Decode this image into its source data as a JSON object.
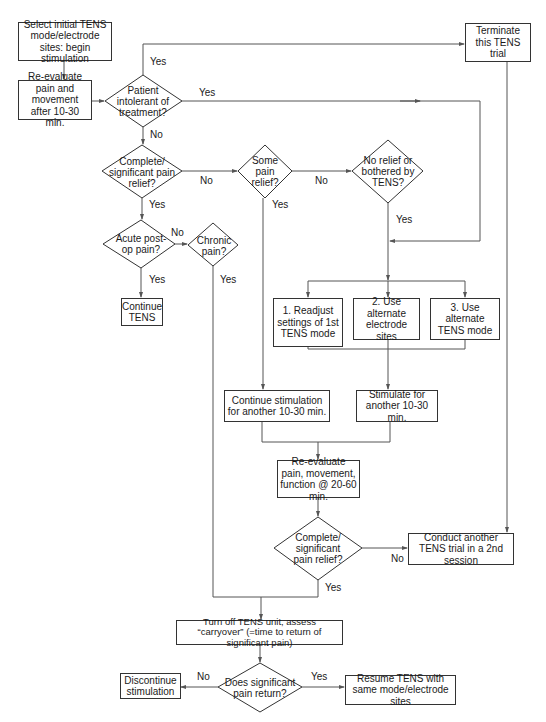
{
  "diagram": {
    "type": "flowchart",
    "colors": {
      "line": "#555555",
      "border": "#333333",
      "text": "#1a1a1a",
      "background": "#ffffff"
    },
    "boxes": {
      "select_initial": "Select initial TENS mode/electrode sites: begin stimulation",
      "reevaluate_1": "Re-evaluate pain and movement after 10-30 min.",
      "terminate": "Terminate this TENS trial",
      "continue_tens": "Continue TENS",
      "option_1": "1. Readjust settings of 1st TENS mode",
      "option_2": "2. Use alternate electrode sites",
      "option_3": "3. Use alternate TENS mode",
      "continue_stim": "Continue stimulation for another 10-30 min.",
      "stimulate": "Stimulate for another 10-30 min.",
      "reevaluate_2": "Re-evaluate pain, movement, function @ 20-60 min.",
      "conduct_another": "Conduct another TENS trial in a 2nd session",
      "turn_off": "Turn off TENS unit, assess “carryover” (=time to return of significant pain)",
      "discontinue": "Discontinue stimulation",
      "resume": "Resume TENS with same mode/electrode sites"
    },
    "decisions": {
      "intolerant": "Patient intolerant of treatment?",
      "complete_relief_1": "Complete/ significant pain relief?",
      "some_relief": "Some pain relief?",
      "no_relief": "No relief or bothered by TENS?",
      "acute_postop": "Acute post-op pain?",
      "chronic": "Chronic pain?",
      "complete_relief_2": "Complete/ significant pain relief?",
      "pain_return": "Does significant pain return?"
    },
    "edge_labels": {
      "intolerant_yes_top": "Yes",
      "intolerant_yes_right": "Yes",
      "intolerant_no": "No",
      "complete1_no": "No",
      "complete1_yes": "Yes",
      "some_no": "No",
      "some_yes": "Yes",
      "norelief_yes": "Yes",
      "acute_no": "No",
      "acute_yes": "Yes",
      "chronic_yes": "Yes",
      "complete2_no": "No",
      "complete2_yes": "Yes",
      "return_no": "No",
      "return_yes": "Yes"
    }
  }
}
